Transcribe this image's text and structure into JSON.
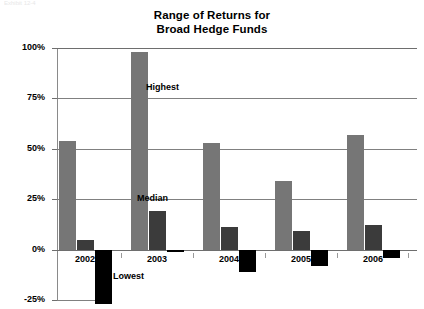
{
  "artifact_text": "Exhibit 12-4",
  "chart_data": {
    "type": "bar",
    "title": "Range of Returns for Broad Hedge Funds",
    "title_lines": [
      "Range of Returns for",
      "Broad Hedge Funds"
    ],
    "xlabel": "",
    "ylabel": "",
    "ylim": [
      -25,
      100
    ],
    "yticks": [
      100,
      75,
      50,
      25,
      0,
      -25
    ],
    "ytick_labels": [
      "100%",
      "75%",
      "50%",
      "25%",
      "0%",
      "-25%"
    ],
    "grid": true,
    "legend": "none",
    "categories": [
      "2002",
      "2003",
      "2004",
      "2005",
      "2006"
    ],
    "series": [
      {
        "name": "Highest",
        "color": "#767676",
        "values": [
          54,
          98,
          53,
          34,
          57
        ]
      },
      {
        "name": "Median",
        "color": "#3b3b3b",
        "values": [
          5,
          19,
          11,
          9,
          12
        ]
      },
      {
        "name": "Lowest",
        "color": "#000000",
        "values": [
          -27,
          -1,
          -11,
          -8,
          -4
        ]
      }
    ],
    "annotations": [
      {
        "text": "Highest",
        "series": "Highest"
      },
      {
        "text": "Median",
        "series": "Median"
      },
      {
        "text": "Lowest",
        "series": "Lowest"
      }
    ]
  }
}
